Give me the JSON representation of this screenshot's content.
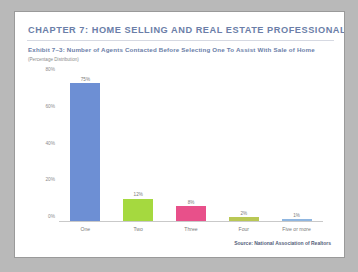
{
  "page": {
    "chapter_title": "CHAPTER 7:  HOME SELLING AND REAL ESTATE PROFESSIONALS",
    "exhibit_title": "Exhibit 7–3:  Number of Agents Contacted Before Selecting One To Assist With Sale of Home",
    "exhibit_note": "(Percentage Distribution)",
    "source": "Source: National Association of Realtors",
    "colors": {
      "heading": "#6b7ea8",
      "page_background": "#ffffff",
      "canvas_background": "#b9b9b9",
      "axis": "#c9c9c9"
    }
  },
  "chart_data": {
    "type": "bar",
    "title": "Exhibit 7–3:  Number of Agents Contacted Before Selecting One To Assist With Sale of Home",
    "subtitle": "(Percentage Distribution)",
    "xlabel": "",
    "ylabel": "",
    "ylim": [
      0,
      80
    ],
    "grid": false,
    "legend": "none",
    "categories": [
      "One",
      "Two",
      "Three",
      "Four",
      "Five or more"
    ],
    "values": [
      75,
      12,
      8,
      2,
      1
    ],
    "value_labels": [
      "75%",
      "12%",
      "8%",
      "2%",
      "1%"
    ],
    "bar_colors": [
      "#6d8fd4",
      "#a5d93f",
      "#e8508a",
      "#b9c855",
      "#8fb6e0"
    ],
    "ytick_labels": [
      "0%",
      "20%",
      "40%",
      "60%",
      "80%"
    ],
    "ytick_values": [
      0,
      20,
      40,
      60,
      80
    ],
    "source": "Source: National Association of Realtors"
  }
}
